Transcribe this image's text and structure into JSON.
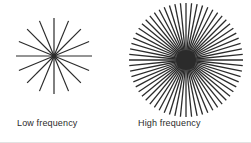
{
  "figure": {
    "background_color": "#ffffff",
    "stroke_color": "#2b2b2b",
    "caption_color": "#2b2b2b"
  },
  "panels": [
    {
      "id": "low-frequency",
      "caption": "Low frequency",
      "pattern": "radial-spoke-star",
      "spoke_count": 16,
      "angular_spacing_deg": 22.5,
      "outer_radius_px": 38,
      "inner_radius_px": 0,
      "stroke_width_px": 1.2,
      "hub_radius_px": 2.6,
      "center_x_px": 42,
      "center_y_px": 42
    },
    {
      "id": "high-frequency",
      "caption": "High frequency",
      "pattern": "radial-spoke-star",
      "spoke_count": 64,
      "angular_spacing_deg": 5.625,
      "outer_radius_px": 57,
      "inner_radius_px": 0,
      "stroke_width_px": 1.3,
      "hub_radius_px": 10,
      "center_x_px": 60,
      "center_y_px": 60
    }
  ],
  "chart_data": {
    "type": "diagram",
    "title": "",
    "categories": [
      "Low frequency",
      "High frequency"
    ],
    "values": [
      16,
      64
    ],
    "ylabel": "Number of radial spokes",
    "xlabel": ""
  }
}
